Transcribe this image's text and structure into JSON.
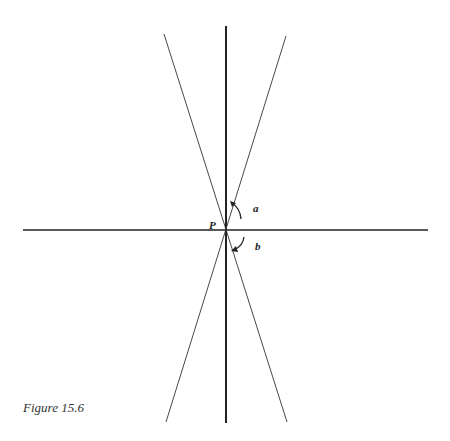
{
  "figure": {
    "caption": "Figure 15.6",
    "point_label": "P",
    "arrow_a_label": "a",
    "arrow_b_label": "b",
    "colors": {
      "line": "#222222",
      "background": "#ffffff"
    }
  }
}
